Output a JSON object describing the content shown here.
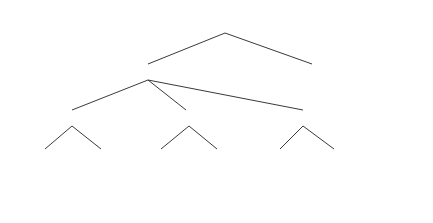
{
  "diagram": {
    "type": "decision-tree",
    "nodes": {
      "root": {
        "label": "IDM"
      },
      "ttype": {
        "label": "TType"
      },
      "leaf_rule8": {
        "label": "Normal",
        "rule": "Rule-8"
      },
      "se": {
        "label": "SE"
      },
      "var": {
        "label": "VAR"
      },
      "imc1": {
        "label": "IMC1"
      },
      "leaf_rule1": {
        "label": "Normal",
        "rule": "Rule-1"
      },
      "leaf_rule2": {
        "label": "Normal",
        "rule": "Rule-2"
      },
      "leaf_rule3": {
        "label": "Normal",
        "rule": "Rule-3"
      },
      "leaf_rule4": {
        "label": "Abnormal",
        "rule": "Rule-4"
      },
      "leaf_rule5": {
        "label": "Normal",
        "rule": "Rule-5"
      },
      "cor": {
        "label": "COR"
      },
      "leaf_rule6": {
        "label": "Normal",
        "rule": "Rule-6"
      },
      "leaf_rule7": {
        "label": "Abnormal",
        "rule": "Rule-7"
      }
    },
    "edges": [
      {
        "from": "root",
        "to": "ttype",
        "label": "1"
      },
      {
        "from": "root",
        "to": "leaf_rule8",
        "label": "2"
      },
      {
        "from": "ttype",
        "to": "se",
        "label": "1"
      },
      {
        "from": "ttype",
        "to": "var",
        "label": "2"
      },
      {
        "from": "ttype",
        "to": "imc1",
        "label": "3"
      },
      {
        "from": "se",
        "to": "leaf_rule1",
        "label": "1"
      },
      {
        "from": "se",
        "to": "leaf_rule2",
        "label": "2"
      },
      {
        "from": "var",
        "to": "leaf_rule3",
        "label": "1"
      },
      {
        "from": "var",
        "to": "leaf_rule4",
        "label": "2"
      },
      {
        "from": "imc1",
        "to": "leaf_rule5",
        "label": "1"
      },
      {
        "from": "imc1",
        "to": "cor",
        "label": "2"
      },
      {
        "from": "cor",
        "to": "leaf_rule6",
        "label": "1"
      },
      {
        "from": "cor",
        "to": "leaf_rule7",
        "label": "2"
      }
    ]
  }
}
